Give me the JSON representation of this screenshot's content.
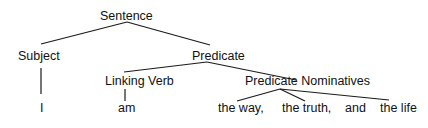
{
  "diagram": {
    "type": "sentence-tree",
    "nodes": {
      "sentence": "Sentence",
      "subject": "Subject",
      "predicate": "Predicate",
      "linking_verb": "Linking Verb",
      "predicate_nominatives": "Predicate Nominatives",
      "word_i": "I",
      "word_am": "am",
      "word_the_way": "the way,",
      "word_the_truth": "the truth,",
      "word_and": "and",
      "word_the_life": "the life"
    },
    "edges": [
      {
        "from": "Sentence",
        "to": "Subject"
      },
      {
        "from": "Sentence",
        "to": "Predicate"
      },
      {
        "from": "Subject",
        "to": "I"
      },
      {
        "from": "Predicate",
        "to": "Linking Verb"
      },
      {
        "from": "Predicate",
        "to": "Predicate Nominatives"
      },
      {
        "from": "Linking Verb",
        "to": "am"
      },
      {
        "from": "Predicate Nominatives",
        "to": "the way,"
      },
      {
        "from": "Predicate Nominatives",
        "to": "the truth,"
      },
      {
        "from": "Predicate Nominatives",
        "to": "the life"
      }
    ],
    "colors": {
      "text": "#111111",
      "line": "#1a1a1a",
      "background": "#ffffff"
    }
  }
}
